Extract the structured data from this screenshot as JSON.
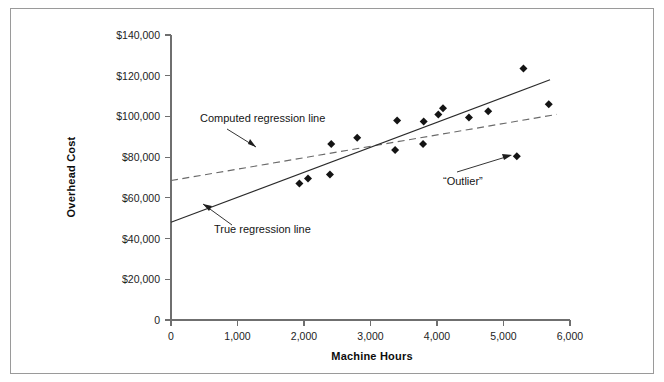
{
  "figure": {
    "cut_top_caption": "",
    "frame_color": "#9a9a9a"
  },
  "chart_data": {
    "type": "scatter",
    "title": "",
    "xlabel": "Machine Hours",
    "ylabel": "Overhead Cost",
    "xlim": [
      0,
      6000
    ],
    "ylim": [
      0,
      140000
    ],
    "grid": false,
    "legend_position": "none",
    "xticks": [
      0,
      1000,
      2000,
      3000,
      4000,
      5000,
      6000
    ],
    "xtick_labels": [
      "0",
      "1,000",
      "2,000",
      "3,000",
      "4,000",
      "5,000",
      "6,000"
    ],
    "yticks": [
      0,
      20000,
      40000,
      60000,
      80000,
      100000,
      120000,
      140000
    ],
    "ytick_labels": [
      "0",
      "$20,000",
      "$40,000",
      "$60,000",
      "$80,000",
      "$100,000",
      "$120,000",
      "$140,000"
    ],
    "series": [
      {
        "name": "Observations",
        "type": "scatter",
        "marker": "diamond",
        "color": "#141414",
        "points": [
          {
            "x": 1930,
            "y": 67000
          },
          {
            "x": 2060,
            "y": 69500
          },
          {
            "x": 2390,
            "y": 71500
          },
          {
            "x": 2410,
            "y": 86500
          },
          {
            "x": 2800,
            "y": 89500
          },
          {
            "x": 3370,
            "y": 83500
          },
          {
            "x": 3400,
            "y": 98000
          },
          {
            "x": 3790,
            "y": 86500
          },
          {
            "x": 3800,
            "y": 97500
          },
          {
            "x": 4020,
            "y": 101000
          },
          {
            "x": 4090,
            "y": 104000
          },
          {
            "x": 4480,
            "y": 99500
          },
          {
            "x": 4770,
            "y": 102500
          },
          {
            "x": 5300,
            "y": 123500
          },
          {
            "x": 5200,
            "y": 80500
          },
          {
            "x": 5680,
            "y": 106000
          }
        ]
      },
      {
        "name": "True regression line",
        "type": "line",
        "style": "solid",
        "color": "#2a2a2a",
        "x": [
          0,
          5700
        ],
        "y": [
          48000,
          118000
        ]
      },
      {
        "name": "Computed regression line",
        "type": "line",
        "style": "dashed",
        "color": "#6a6a6a",
        "x": [
          0,
          5800
        ],
        "y": [
          68500,
          101000
        ]
      }
    ],
    "annotations": [
      {
        "id": "computed-regression-line",
        "text": "Computed regression line",
        "text_x": 1080,
        "text_y": 112000,
        "target_x": 2150,
        "target_y": 89000
      },
      {
        "id": "true-regression-line",
        "text": "True regression line",
        "text_x": 1560,
        "text_y": 43500,
        "target_x": 1060,
        "target_y": 60500
      },
      {
        "id": "outlier",
        "text": "“Outlier”",
        "text_x": 4150,
        "text_y": 71000,
        "target_x": 5120,
        "target_y": 80500
      }
    ]
  }
}
